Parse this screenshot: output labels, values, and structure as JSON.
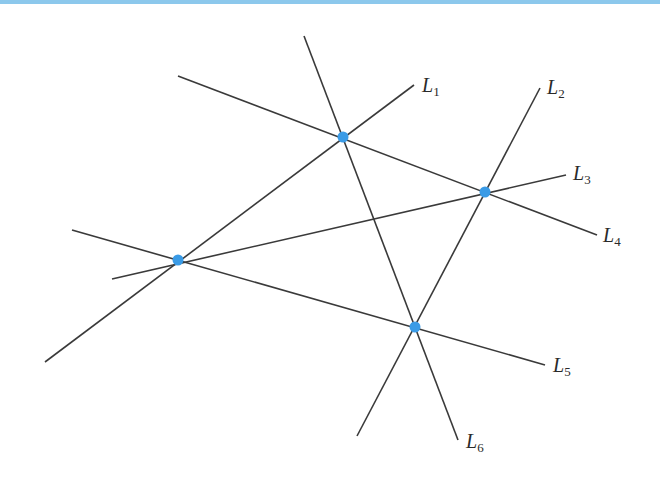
{
  "diagram": {
    "accent_bar_color": "#8cc8ec",
    "point_color": "#3a9be6",
    "line_color": "#3a3a3a",
    "lines": [
      {
        "id": "L1",
        "letter": "L",
        "sub": "1",
        "x1": 45,
        "y1": 362,
        "x2": 414,
        "y2": 85,
        "label_x": 422,
        "label_y": 92
      },
      {
        "id": "L2",
        "letter": "L",
        "sub": "2",
        "x1": 357,
        "y1": 436,
        "x2": 540,
        "y2": 88,
        "label_x": 547,
        "label_y": 94
      },
      {
        "id": "L3",
        "letter": "L",
        "sub": "3",
        "x1": 112,
        "y1": 279,
        "x2": 566,
        "y2": 175,
        "label_x": 573,
        "label_y": 180
      },
      {
        "id": "L4",
        "letter": "L",
        "sub": "4",
        "x1": 178,
        "y1": 76,
        "x2": 597,
        "y2": 235,
        "label_x": 603,
        "label_y": 242
      },
      {
        "id": "L5",
        "letter": "L",
        "sub": "5",
        "x1": 72,
        "y1": 230,
        "x2": 545,
        "y2": 365,
        "label_x": 553,
        "label_y": 372
      },
      {
        "id": "L6",
        "letter": "L",
        "sub": "6",
        "x1": 304,
        "y1": 36,
        "x2": 458,
        "y2": 440,
        "label_x": 466,
        "label_y": 448
      }
    ],
    "points": [
      {
        "name": "intersection-L1-L4-L6",
        "x": 343,
        "y": 137
      },
      {
        "name": "intersection-L2-L3-L4",
        "x": 485,
        "y": 192
      },
      {
        "name": "intersection-L1-L3-L5",
        "x": 178,
        "y": 260
      },
      {
        "name": "intersection-L2-L5-L6",
        "x": 415,
        "y": 327
      }
    ]
  }
}
